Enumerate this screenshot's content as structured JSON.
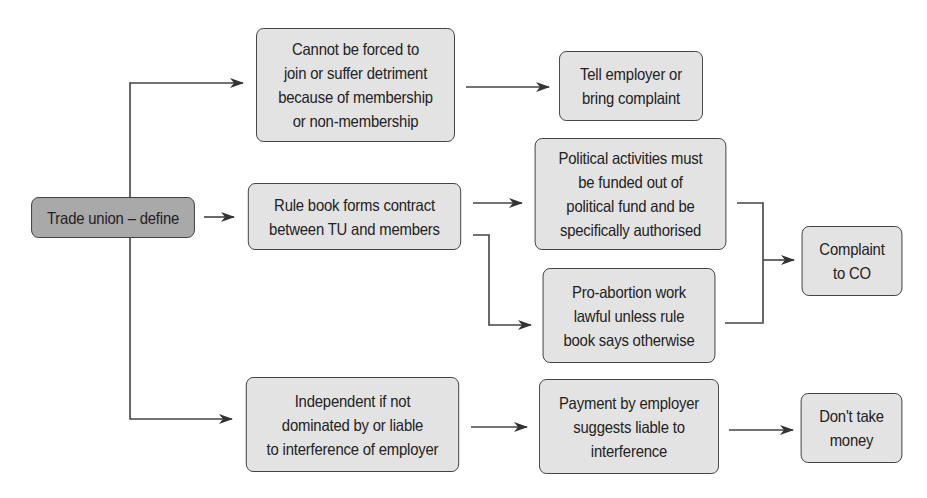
{
  "diagram": {
    "type": "flowchart",
    "colors": {
      "root_fill": "#a9a9a9",
      "node_fill": "#e3e3e3",
      "stroke": "#3a3a3a"
    },
    "nodes": {
      "root": {
        "label": "Trade union – define"
      },
      "forced": {
        "label": "Cannot be forced to\njoin or suffer detriment\nbecause of membership\nor non-membership"
      },
      "tell_employer": {
        "label": "Tell employer or\nbring complaint"
      },
      "rule_book": {
        "label": "Rule book forms contract\nbetween TU and members"
      },
      "political": {
        "label": "Political activities must\nbe funded out of\npolitical fund and be\nspecifically authorised"
      },
      "pro_abortion": {
        "label": "Pro-abortion work\nlawful unless rule\nbook says otherwise"
      },
      "complaint_co": {
        "label": "Complaint\nto CO"
      },
      "independent": {
        "label": "Independent if not\ndominated by or liable\nto interference of employer"
      },
      "payment": {
        "label": "Payment by employer\nsuggests liable to\ninterference"
      },
      "dont_take": {
        "label": "Don't take\nmoney"
      }
    },
    "edges": [
      {
        "from": "root",
        "to": "forced"
      },
      {
        "from": "root",
        "to": "rule_book"
      },
      {
        "from": "root",
        "to": "independent"
      },
      {
        "from": "forced",
        "to": "tell_employer"
      },
      {
        "from": "rule_book",
        "to": "political"
      },
      {
        "from": "rule_book",
        "to": "pro_abortion"
      },
      {
        "from": "political",
        "to": "complaint_co"
      },
      {
        "from": "pro_abortion",
        "to": "complaint_co"
      },
      {
        "from": "independent",
        "to": "payment"
      },
      {
        "from": "payment",
        "to": "dont_take"
      }
    ]
  }
}
